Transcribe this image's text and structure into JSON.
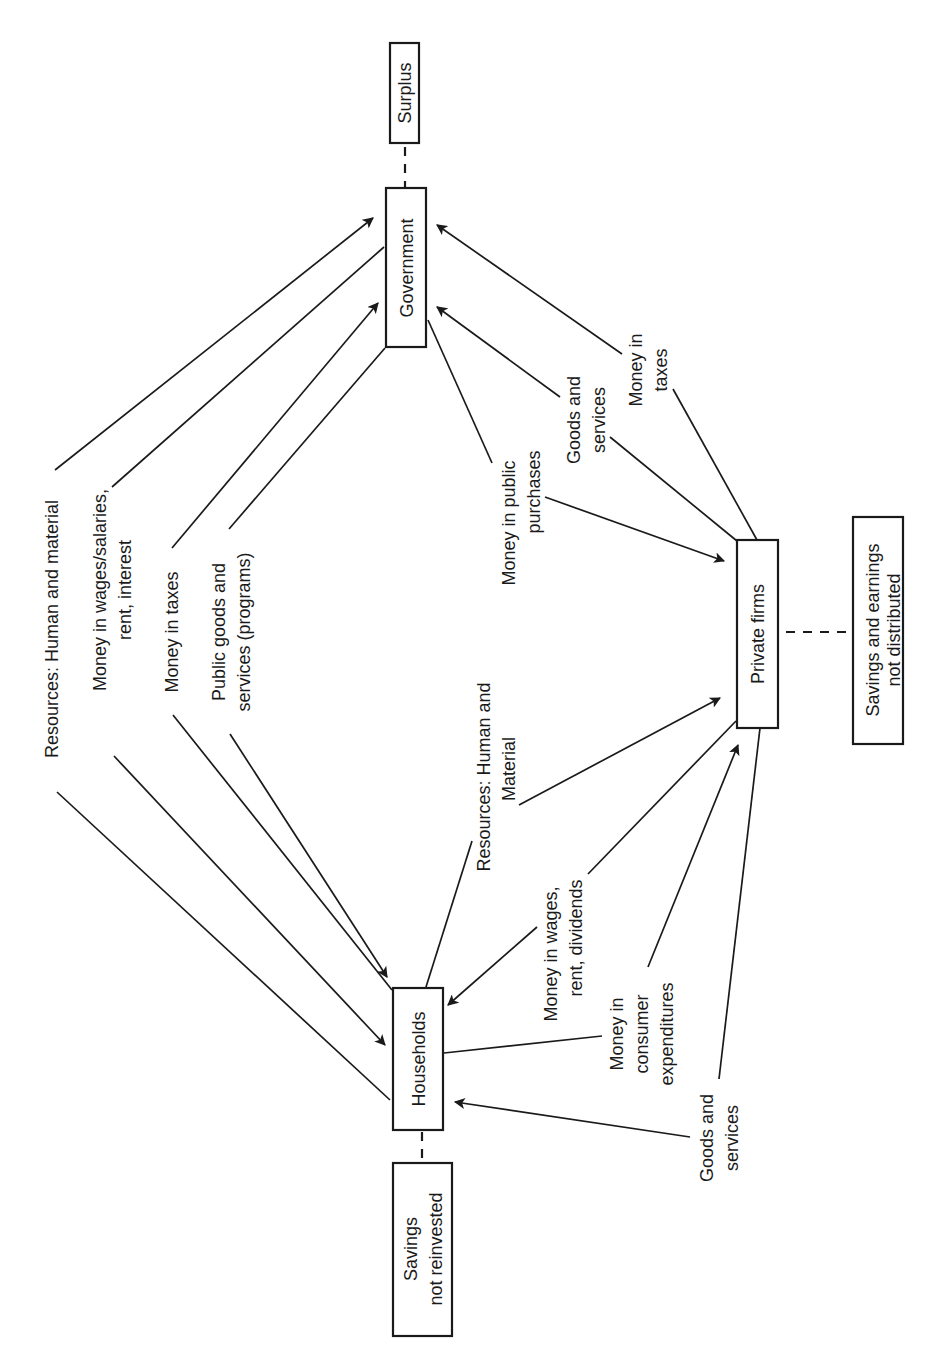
{
  "colors": {
    "ink": "#1a1a1a",
    "background": "#ffffff"
  },
  "nodes": {
    "surplus": "Surplus",
    "government": "Government",
    "private_firms": "Private firms",
    "households": "Households",
    "savings_not_reinvested": [
      "Savings",
      "not reinvested"
    ],
    "savings_earnings_not_distributed": [
      "Savings and earnings",
      "not distributed"
    ]
  },
  "flows": {
    "gov_households_resources": [
      "Resources:  Human and material"
    ],
    "gov_households_wages": [
      "Money in wages/salaries,",
      "rent, interest"
    ],
    "gov_households_taxes": [
      "Money in taxes"
    ],
    "gov_households_public_goods": [
      "Public goods and",
      "services (programs)"
    ],
    "gov_firms_public_purchases": [
      "Money in public",
      "purchases"
    ],
    "gov_firms_goods_services": [
      "Goods and",
      "services"
    ],
    "gov_firms_taxes": [
      "Money in",
      "taxes"
    ],
    "firms_households_resources": [
      "Resources:  Human and",
      "Material"
    ],
    "firms_households_wages": [
      "Money in wages,",
      "rent, dividends"
    ],
    "firms_households_consumer": [
      "Money in",
      "consumer",
      "expenditures"
    ],
    "firms_households_goods_services": [
      "Goods and",
      "services"
    ]
  }
}
